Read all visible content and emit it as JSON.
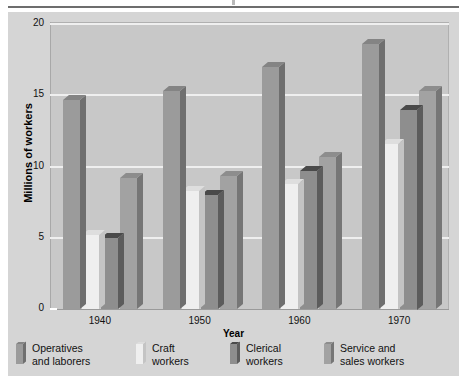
{
  "chart_data": {
    "type": "bar",
    "title": "",
    "subtitle": "",
    "xlabel": "Year",
    "ylabel": "Millions of workers",
    "categories": [
      "1940",
      "1950",
      "1960",
      "1970"
    ],
    "ylim": [
      0,
      20
    ],
    "yticks": [
      0,
      5,
      10,
      15,
      20
    ],
    "ytick_labels": [
      "0",
      "5",
      "10",
      "15",
      "20"
    ],
    "grid": true,
    "grid_axis": "y",
    "legend_position": "bottom",
    "style": "3d-bar",
    "series": [
      {
        "name": "Operatives and laborers",
        "name_line1": "Operatives",
        "name_line2": "and laborers",
        "color": "#9b9b9b",
        "side_color": "#6f6f6f",
        "top_color": "#848484",
        "values": [
          14.7,
          15.3,
          17.0,
          18.6
        ]
      },
      {
        "name": "Craft workers",
        "name_line1": "Craft",
        "name_line2": "workers",
        "color": "#efefef",
        "side_color": "#c4c4c4",
        "top_color": "#dedede",
        "values": [
          5.2,
          8.3,
          8.8,
          11.6
        ]
      },
      {
        "name": "Clerical workers",
        "name_line1": "Clerical",
        "name_line2": "workers",
        "color": "#8e8e8e",
        "side_color": "#5c5c5c",
        "top_color": "#4a4a4a",
        "values": [
          5.0,
          8.0,
          9.7,
          14.0
        ]
      },
      {
        "name": "Service and sales workers",
        "name_line1": "Service and",
        "name_line2": "sales workers",
        "color": "#a2a2a2",
        "side_color": "#767676",
        "top_color": "#8d8d8d",
        "values": [
          9.2,
          9.3,
          10.7,
          15.3
        ]
      }
    ]
  },
  "colors": {
    "page_background": "#ffffff",
    "figure_background": "#d5d5d5",
    "plot_background": "#c8c8c8",
    "gridline": "#efefef",
    "text": "#111111",
    "rule": "#6d6d6d"
  }
}
